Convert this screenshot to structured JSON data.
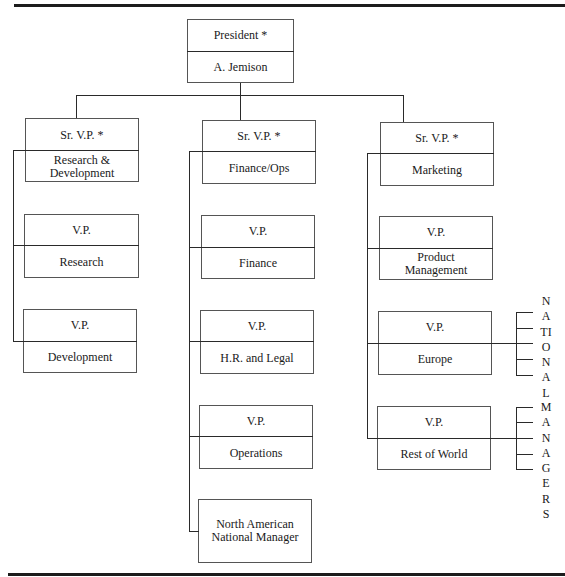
{
  "chart": {
    "president": {
      "title": "President *",
      "name": "A. Jemison"
    },
    "divisions": [
      {
        "title": "Sr. V.P. *",
        "name": "Research & Development",
        "reports": [
          {
            "title": "V.P.",
            "name": "Research"
          },
          {
            "title": "V.P.",
            "name": "Development"
          }
        ]
      },
      {
        "title": "Sr. V.P. *",
        "name": "Finance/Ops",
        "reports": [
          {
            "title": "V.P.",
            "name": "Finance"
          },
          {
            "title": "V.P.",
            "name": "H.R. and Legal"
          },
          {
            "title": "V.P.",
            "name": "Operations"
          },
          {
            "title": "",
            "name": "North American National Manager"
          }
        ]
      },
      {
        "title": "Sr. V.P. *",
        "name": "Marketing",
        "reports": [
          {
            "title": "V.P.",
            "name": "Product Management"
          },
          {
            "title": "V.P.",
            "name": "Europe"
          },
          {
            "title": "V.P.",
            "name": "Rest of World"
          }
        ]
      }
    ],
    "side_labels": {
      "europe": "NATIONAL",
      "rest_of_world": "MANAGERS"
    }
  }
}
